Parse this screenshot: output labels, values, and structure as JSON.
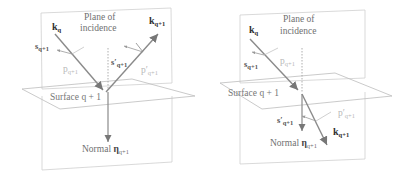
{
  "figures": [
    {
      "id": "reflection",
      "plane_label_line1": "Plane of",
      "plane_label_line2": "incidence",
      "incident_vector": {
        "symbol": "k",
        "sub": "q"
      },
      "outgoing_vector": {
        "symbol": "k",
        "sub": "q+1"
      },
      "s_in": {
        "symbol": "s",
        "sub": "q+1"
      },
      "p_in": {
        "symbol": "p",
        "sub": "q+1"
      },
      "s_out": {
        "symbol": "s′",
        "sub": "q+1"
      },
      "p_out": {
        "symbol": "p′",
        "sub": "q+1"
      },
      "surface_label": "Surface q + 1",
      "normal_label": "Normal",
      "normal_vector": {
        "symbol": "η",
        "sub": "q+1"
      }
    },
    {
      "id": "refraction",
      "plane_label_line1": "Plane of",
      "plane_label_line2": "incidence",
      "incident_vector": {
        "symbol": "k",
        "sub": "q"
      },
      "outgoing_vector": {
        "symbol": "k",
        "sub": "q+1"
      },
      "s_in": {
        "symbol": "s",
        "sub": "q+1"
      },
      "p_in": {
        "symbol": "p",
        "sub": "q+1"
      },
      "s_out": {
        "symbol": "s′",
        "sub": "q+1"
      },
      "p_out": {
        "symbol": "p′",
        "sub": "q+1"
      },
      "surface_label": "Surface q + 1",
      "normal_label": "Normal",
      "normal_vector": {
        "symbol": "η",
        "sub": "q+1"
      }
    }
  ],
  "colors": {
    "plane_stroke": "#c8c8c8",
    "vector_stroke": "#8a8a8a",
    "light_label": "#b8b8b8",
    "dark_label": "#303030"
  }
}
